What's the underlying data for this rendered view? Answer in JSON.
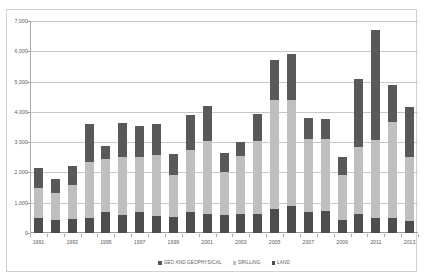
{
  "chart_data": {
    "type": "bar",
    "subtype": "stacked",
    "title": "",
    "xlabel": "",
    "ylabel": "",
    "ylim": [
      0,
      7000
    ],
    "ytick_values": [
      0,
      1000,
      2000,
      3000,
      4000,
      5000,
      6000,
      7000
    ],
    "ytick_labels": [
      "0",
      "1,000",
      "2,000",
      "3,000",
      "4,000",
      "5,000",
      "6,000",
      "7,000"
    ],
    "grid": true,
    "legend_position": "bottom",
    "categories": [
      "1991",
      "1992",
      "1993",
      "1994",
      "1995",
      "1996",
      "1997",
      "1998",
      "1999",
      "2000",
      "2001",
      "2002",
      "2003",
      "2004",
      "2005",
      "2006",
      "2007",
      "2008",
      "2009",
      "2010",
      "2011",
      "2012",
      "2013"
    ],
    "xtick_labels_shown": [
      "1991",
      "1993",
      "1995",
      "1997",
      "1999",
      "2001",
      "2003",
      "2005",
      "2007",
      "2009",
      "2011",
      "2013"
    ],
    "series": [
      {
        "name": "LAND",
        "color": "#4d4d4d",
        "values": [
          480,
          430,
          460,
          500,
          700,
          600,
          700,
          560,
          540,
          700,
          640,
          600,
          620,
          640,
          800,
          900,
          700,
          720,
          420,
          620,
          480,
          500,
          400
        ]
      },
      {
        "name": "DRILLING",
        "color": "#bfbfbf",
        "values": [
          1020,
          900,
          1130,
          1830,
          1750,
          1900,
          1820,
          2010,
          1380,
          2040,
          2400,
          1400,
          1920,
          2400,
          3600,
          3500,
          2420,
          2400,
          1500,
          2220,
          2600,
          3180,
          2100
        ]
      },
      {
        "name": "GEO AND GEOPHYSICAL",
        "color": "#595959",
        "values": [
          650,
          470,
          610,
          1270,
          420,
          1120,
          1030,
          1030,
          680,
          1160,
          1160,
          650,
          480,
          900,
          1300,
          1500,
          680,
          660,
          580,
          2260,
          3620,
          1220,
          1650
        ]
      }
    ],
    "totals": [
      2150,
      1800,
      2200,
      3600,
      2870,
      3620,
      3550,
      3600,
      2600,
      3900,
      4200,
      2650,
      3020,
      3940,
      5700,
      5900,
      3820,
      3780,
      2500,
      5100,
      6700,
      4900,
      4150
    ]
  },
  "legend": {
    "items": [
      {
        "label": "GEO AND GEOPHYSICAL",
        "color": "#595959"
      },
      {
        "label": "DRILLING",
        "color": "#bfbfbf"
      },
      {
        "label": "LAND",
        "color": "#4d4d4d"
      }
    ]
  }
}
